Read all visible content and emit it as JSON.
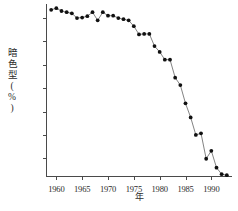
{
  "axes": {
    "ylabel": "暗色型(%)",
    "xlabel": "年",
    "yticks": [
      30,
      40,
      50,
      60,
      70,
      80,
      90
    ],
    "xticks": [
      1960,
      1965,
      1970,
      1975,
      1980,
      1985,
      1990
    ]
  },
  "chart_data": {
    "type": "line",
    "title": "",
    "subtitle": "",
    "xlabel": "年",
    "ylabel": "暗色型(%)",
    "xlim": [
      1958,
      1994
    ],
    "ylim": [
      22,
      96
    ],
    "grid": false,
    "legend": false,
    "markers": "filled-circle",
    "marker_color": "#111111",
    "line_color": "#4d4d4d",
    "x": [
      1959,
      1960,
      1961,
      1962,
      1963,
      1964,
      1965,
      1966,
      1967,
      1968,
      1969,
      1970,
      1971,
      1972,
      1973,
      1974,
      1975,
      1976,
      1977,
      1978,
      1979,
      1980,
      1981,
      1982,
      1983,
      1984,
      1985,
      1986,
      1987,
      1988,
      1989,
      1990,
      1991,
      1992,
      1993
    ],
    "values": [
      93.5,
      94.2,
      93.0,
      92.5,
      92.0,
      90.0,
      90.2,
      90.8,
      92.5,
      89.0,
      92.5,
      91.0,
      91.0,
      90.0,
      89.5,
      89.0,
      86.5,
      83.0,
      83.2,
      83.2,
      78.0,
      75.5,
      72.2,
      72.2,
      64.5,
      61.3,
      53.5,
      47.5,
      40.0,
      40.7,
      29.8,
      33.2,
      26.0,
      23.2,
      22.8
    ],
    "series": [
      {
        "name": "暗色型頻度",
        "values": [
          93.5,
          94.2,
          93.0,
          92.5,
          92.0,
          90.0,
          90.2,
          90.8,
          92.5,
          89.0,
          92.5,
          91.0,
          91.0,
          90.0,
          89.5,
          89.0,
          86.5,
          83.0,
          83.2,
          83.2,
          78.0,
          75.5,
          72.2,
          72.2,
          64.5,
          61.3,
          53.5,
          47.5,
          40.0,
          40.7,
          29.8,
          33.2,
          26.0,
          23.2,
          22.8
        ]
      }
    ]
  }
}
